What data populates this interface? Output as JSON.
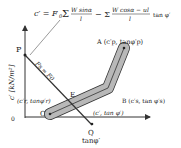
{
  "formula": {
    "lhs": "c′ = F",
    "lhs_sub": "0",
    "sum1": "Σ",
    "frac1_num": "W sinα",
    "frac1_den": "l",
    "minus": "− Σ",
    "frac2_num": "W cosα − ul",
    "frac2_den": "l",
    "tail": "tan φ′"
  },
  "axes": {
    "ylabel": "c′ [kN/m²]",
    "xlabel": "tanφ′",
    "origin": "0"
  },
  "points": {
    "P": "P",
    "Q": "Q",
    "E": "E",
    "A": "A (c′p, tanφ′p)",
    "B": "B (c′s, tan φ′s)",
    "C": "C",
    "C_label": "(c′r, tanφ′r)",
    "E_label": "(c′, tan φ′)"
  },
  "line_label": "Fs = F0",
  "colors": {
    "band_fill": "#b8b8b8",
    "band_stroke": "#333333",
    "axis": "#333333"
  }
}
